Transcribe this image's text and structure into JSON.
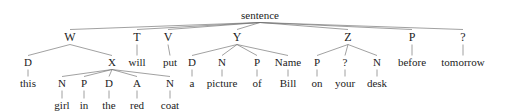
{
  "diagram": {
    "title": "sentence",
    "type": "syntax-parse-tree",
    "sentence_text": "this girl in the red coat will put a picture of Bill on your desk before tomorrow",
    "stroke_color": "#6e6e6e",
    "text_color": "#1c1c1c",
    "levels_y": [
      10,
      31,
      57,
      78,
      100
    ],
    "nodes": [
      {
        "id": "sentence",
        "label": "sentence",
        "x": 260,
        "y": 10,
        "level": 0,
        "cls": "lvl-root"
      },
      {
        "id": "W",
        "label": "W",
        "x": 70,
        "y": 31,
        "level": 1,
        "cls": "lvl-cat"
      },
      {
        "id": "T",
        "label": "T",
        "x": 137,
        "y": 31,
        "level": 1,
        "cls": "lvl-cat"
      },
      {
        "id": "V",
        "label": "V",
        "x": 168,
        "y": 31,
        "level": 1,
        "cls": "lvl-cat"
      },
      {
        "id": "Y",
        "label": "Y",
        "x": 237,
        "y": 31,
        "level": 1,
        "cls": "lvl-cat"
      },
      {
        "id": "Z",
        "label": "Z",
        "x": 348,
        "y": 31,
        "level": 1,
        "cls": "lvl-cat"
      },
      {
        "id": "Pbefore",
        "label": "P",
        "x": 412,
        "y": 31,
        "level": 1,
        "cls": "lvl-cat"
      },
      {
        "id": "Qtom",
        "label": "?",
        "x": 463,
        "y": 31,
        "level": 1,
        "cls": "lvl-cat"
      },
      {
        "id": "Dthis",
        "label": "D",
        "x": 28,
        "y": 57,
        "level": 2,
        "cls": "lvl-mid"
      },
      {
        "id": "X",
        "label": "X",
        "x": 112,
        "y": 57,
        "level": 2,
        "cls": "lvl-mid"
      },
      {
        "id": "will",
        "label": "will",
        "x": 137,
        "y": 57,
        "level": 2,
        "cls": "lvl-mid"
      },
      {
        "id": "put",
        "label": "put",
        "x": 170,
        "y": 57,
        "level": 2,
        "cls": "lvl-mid"
      },
      {
        "id": "Da",
        "label": "D",
        "x": 192,
        "y": 57,
        "level": 2,
        "cls": "lvl-mid"
      },
      {
        "id": "Npicture",
        "label": "N",
        "x": 222,
        "y": 57,
        "level": 2,
        "cls": "lvl-mid"
      },
      {
        "id": "Pof",
        "label": "P",
        "x": 257,
        "y": 57,
        "level": 2,
        "cls": "lvl-mid"
      },
      {
        "id": "NameBill",
        "label": "Name",
        "x": 288,
        "y": 57,
        "level": 2,
        "cls": "lvl-mid"
      },
      {
        "id": "Pon",
        "label": "P",
        "x": 317,
        "y": 57,
        "level": 2,
        "cls": "lvl-mid"
      },
      {
        "id": "Qyour",
        "label": "?",
        "x": 345,
        "y": 57,
        "level": 2,
        "cls": "lvl-mid"
      },
      {
        "id": "Ndesk",
        "label": "N",
        "x": 377,
        "y": 57,
        "level": 2,
        "cls": "lvl-mid"
      },
      {
        "id": "before",
        "label": "before",
        "x": 412,
        "y": 57,
        "level": 2,
        "cls": "lvl-mid"
      },
      {
        "id": "tomorrow",
        "label": "tomorrow",
        "x": 463,
        "y": 57,
        "level": 2,
        "cls": "lvl-mid"
      },
      {
        "id": "this",
        "label": "this",
        "x": 28,
        "y": 78,
        "level": 3,
        "cls": "lvl-leaf"
      },
      {
        "id": "Ngirl",
        "label": "N",
        "x": 62,
        "y": 78,
        "level": 3,
        "cls": "lvl-leaf"
      },
      {
        "id": "Pin",
        "label": "P",
        "x": 84,
        "y": 78,
        "level": 3,
        "cls": "lvl-leaf"
      },
      {
        "id": "Dthe",
        "label": "D",
        "x": 109,
        "y": 78,
        "level": 3,
        "cls": "lvl-leaf"
      },
      {
        "id": "Ared",
        "label": "A",
        "x": 137,
        "y": 78,
        "level": 3,
        "cls": "lvl-leaf"
      },
      {
        "id": "Ncoat",
        "label": "N",
        "x": 170,
        "y": 78,
        "level": 3,
        "cls": "lvl-leaf"
      },
      {
        "id": "a",
        "label": "a",
        "x": 192,
        "y": 78,
        "level": 3,
        "cls": "lvl-leaf"
      },
      {
        "id": "picture",
        "label": "picture",
        "x": 222,
        "y": 78,
        "level": 3,
        "cls": "lvl-leaf"
      },
      {
        "id": "of",
        "label": "of",
        "x": 257,
        "y": 78,
        "level": 3,
        "cls": "lvl-leaf"
      },
      {
        "id": "Bill",
        "label": "Bill",
        "x": 288,
        "y": 78,
        "level": 3,
        "cls": "lvl-leaf"
      },
      {
        "id": "on",
        "label": "on",
        "x": 317,
        "y": 78,
        "level": 3,
        "cls": "lvl-leaf"
      },
      {
        "id": "your",
        "label": "your",
        "x": 345,
        "y": 78,
        "level": 3,
        "cls": "lvl-leaf"
      },
      {
        "id": "desk",
        "label": "desk",
        "x": 377,
        "y": 78,
        "level": 3,
        "cls": "lvl-leaf"
      },
      {
        "id": "girl",
        "label": "girl",
        "x": 62,
        "y": 100,
        "level": 4,
        "cls": "lvl-leaf"
      },
      {
        "id": "in",
        "label": "in",
        "x": 84,
        "y": 100,
        "level": 4,
        "cls": "lvl-leaf"
      },
      {
        "id": "the",
        "label": "the",
        "x": 109,
        "y": 100,
        "level": 4,
        "cls": "lvl-leaf"
      },
      {
        "id": "red",
        "label": "red",
        "x": 137,
        "y": 100,
        "level": 4,
        "cls": "lvl-leaf"
      },
      {
        "id": "coat",
        "label": "coat",
        "x": 170,
        "y": 100,
        "level": 4,
        "cls": "lvl-leaf"
      }
    ],
    "edges": [
      {
        "from": "sentence",
        "to": "W"
      },
      {
        "from": "sentence",
        "to": "T"
      },
      {
        "from": "sentence",
        "to": "V"
      },
      {
        "from": "sentence",
        "to": "Y"
      },
      {
        "from": "sentence",
        "to": "Z"
      },
      {
        "from": "sentence",
        "to": "Pbefore"
      },
      {
        "from": "sentence",
        "to": "Qtom"
      },
      {
        "from": "W",
        "to": "Dthis"
      },
      {
        "from": "W",
        "to": "X"
      },
      {
        "from": "T",
        "to": "will"
      },
      {
        "from": "V",
        "to": "put"
      },
      {
        "from": "Y",
        "to": "Da"
      },
      {
        "from": "Y",
        "to": "Npicture"
      },
      {
        "from": "Y",
        "to": "Pof"
      },
      {
        "from": "Y",
        "to": "NameBill"
      },
      {
        "from": "Z",
        "to": "Pon"
      },
      {
        "from": "Z",
        "to": "Qyour"
      },
      {
        "from": "Z",
        "to": "Ndesk"
      },
      {
        "from": "Pbefore",
        "to": "before"
      },
      {
        "from": "Qtom",
        "to": "tomorrow"
      },
      {
        "from": "Dthis",
        "to": "this"
      },
      {
        "from": "X",
        "to": "Ngirl"
      },
      {
        "from": "X",
        "to": "Pin"
      },
      {
        "from": "X",
        "to": "Dthe"
      },
      {
        "from": "X",
        "to": "Ared"
      },
      {
        "from": "X",
        "to": "Ncoat"
      },
      {
        "from": "Da",
        "to": "a"
      },
      {
        "from": "Npicture",
        "to": "picture"
      },
      {
        "from": "Pof",
        "to": "of"
      },
      {
        "from": "NameBill",
        "to": "Bill"
      },
      {
        "from": "Pon",
        "to": "on"
      },
      {
        "from": "Qyour",
        "to": "your"
      },
      {
        "from": "Ndesk",
        "to": "desk"
      },
      {
        "from": "Ngirl",
        "to": "girl"
      },
      {
        "from": "Pin",
        "to": "in"
      },
      {
        "from": "Dthe",
        "to": "the"
      },
      {
        "from": "Ared",
        "to": "red"
      },
      {
        "from": "Ncoat",
        "to": "coat"
      }
    ]
  }
}
